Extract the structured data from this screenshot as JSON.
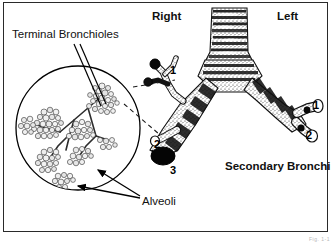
{
  "figure": {
    "caption": "Fig. 1-1"
  },
  "labels": {
    "terminal_bronchioles": "Terminal Bronchioles",
    "alveoli": "Alveoli",
    "right": "Right",
    "left": "Left",
    "secondary_bronchi": "Secondary Bronchi"
  },
  "numbers": {
    "right_upper": "1",
    "right_middle": "2",
    "right_lower": "3",
    "left_upper": "1",
    "left_lower": "2"
  },
  "colors": {
    "ink": "#000000",
    "border": "#2a2a2a",
    "background": "#ffffff",
    "page": "#f2f2f2"
  }
}
